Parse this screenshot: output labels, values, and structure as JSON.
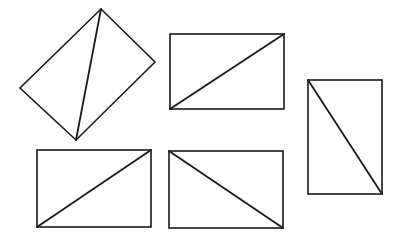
{
  "diagram": {
    "stroke_color": "#1a1a1a",
    "background": "#ffffff",
    "figures": [
      {
        "id": "figure-1",
        "kind": "rotated-rectangle",
        "vertices": [
          [
            101,
            9
          ],
          [
            155,
            62
          ],
          [
            76,
            140
          ],
          [
            20,
            88
          ]
        ],
        "diagonal": [
          [
            101,
            9
          ],
          [
            76,
            140
          ]
        ]
      },
      {
        "id": "figure-2",
        "kind": "rectangle",
        "x": 170,
        "y": 34,
        "width": 114,
        "height": 75,
        "diagonal": [
          [
            170,
            109
          ],
          [
            284,
            34
          ]
        ]
      },
      {
        "id": "figure-3",
        "kind": "rectangle",
        "x": 308,
        "y": 80,
        "width": 74,
        "height": 114,
        "diagonal": [
          [
            308,
            80
          ],
          [
            382,
            194
          ]
        ]
      },
      {
        "id": "figure-4",
        "kind": "rectangle",
        "x": 37,
        "y": 150,
        "width": 114,
        "height": 77,
        "diagonal": [
          [
            37,
            227
          ],
          [
            151,
            150
          ]
        ]
      },
      {
        "id": "figure-5",
        "kind": "rectangle",
        "x": 169,
        "y": 151,
        "width": 114,
        "height": 77,
        "diagonal": [
          [
            169,
            151
          ],
          [
            283,
            228
          ]
        ]
      }
    ]
  }
}
